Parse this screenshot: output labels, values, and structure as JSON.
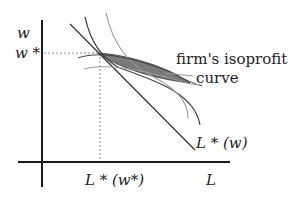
{
  "diagram": {
    "type": "economics-isoprofit-diagram",
    "axes": {
      "y_label": "w",
      "x_label": "L"
    },
    "markers": {
      "w_star_label": "w *",
      "l_star_label": "L * (w*)"
    },
    "curves": {
      "labor_demand_label": "L * (w)",
      "isoprofit_label_line1": "firm's isoprofit",
      "isoprofit_label_line2": "curve"
    },
    "colors": {
      "axis": "#1a1a1a",
      "line": "#333333",
      "curve_dark": "#444444",
      "curve_light": "#9a9a9a",
      "shaded_region": "#7a7a7a",
      "dotted": "#888888"
    }
  }
}
